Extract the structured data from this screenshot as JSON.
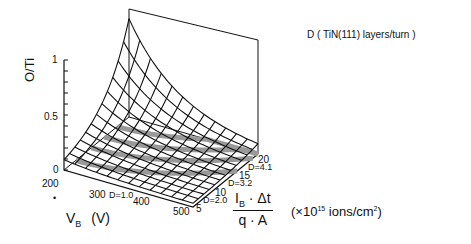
{
  "chart_data": {
    "type": "surface3d",
    "title": "",
    "zlabel": "O/Ti",
    "xlabel": "V_B (V)",
    "ylabel": "I_B·Δt / q·A (×10^15 ions/cm²)",
    "legend_annotation": "D ( TiN(111) layers/turn )",
    "x_ticks": [
      "200",
      "300",
      "400",
      "500"
    ],
    "y_ticks": [
      "5",
      "10",
      "15",
      "20"
    ],
    "z_ticks": [
      "0",
      "0.5",
      "1"
    ],
    "xlim": [
      200,
      500
    ],
    "ylim": [
      0,
      20
    ],
    "zlim": [
      0,
      1
    ],
    "contours": [
      {
        "label": "D=1.0"
      },
      {
        "label": "D=2.0"
      },
      {
        "label": "D=3.2"
      },
      {
        "label": "D=4.1"
      }
    ]
  },
  "labels": {
    "zaxis": "O/Ti",
    "legend": "D ( TiN(111) layers/turn )",
    "xaxis_main": "V",
    "xaxis_sub": "B",
    "xaxis_unit": "(V)",
    "frac_num_main": "I",
    "frac_num_sub": "B",
    "frac_num_rest": " · Δt",
    "frac_den": "q · A",
    "units_pre": "(×10",
    "units_exp": "15",
    "units_mid": " ions/cm",
    "units_sq": "2",
    "units_post": ")",
    "dot": "•"
  }
}
